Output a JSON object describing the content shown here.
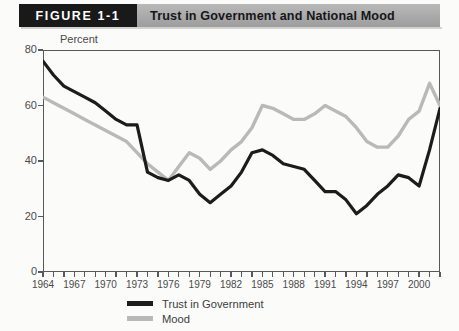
{
  "header": {
    "figure_tag": "FIGURE 1-1",
    "title": "Trust in Government and National Mood"
  },
  "chart_data": {
    "type": "line",
    "title": "Trust in Government and National Mood",
    "xlabel": "",
    "ylabel": "Percent",
    "ylim": [
      0,
      80
    ],
    "xlim": [
      1964,
      2002
    ],
    "yticks": [
      0,
      20,
      40,
      60,
      80
    ],
    "xticks": [
      1964,
      1967,
      1970,
      1973,
      1976,
      1979,
      1982,
      1985,
      1988,
      1991,
      1994,
      1997,
      2000
    ],
    "x_tick_interval_minor": 1,
    "grid": false,
    "legend_position": "bottom-center",
    "x": [
      1964,
      1965,
      1966,
      1967,
      1968,
      1969,
      1970,
      1971,
      1972,
      1973,
      1974,
      1975,
      1976,
      1977,
      1978,
      1979,
      1980,
      1981,
      1982,
      1983,
      1984,
      1985,
      1986,
      1987,
      1988,
      1989,
      1990,
      1991,
      1992,
      1993,
      1994,
      1995,
      1996,
      1997,
      1998,
      1999,
      2000,
      2001,
      2002
    ],
    "series": [
      {
        "name": "Trust in Government",
        "color": "#1c1c1c",
        "values": [
          76,
          71,
          67,
          65,
          63,
          61,
          58,
          55,
          53,
          53,
          36,
          34,
          33,
          35,
          33,
          28,
          25,
          28,
          31,
          36,
          43,
          44,
          42,
          39,
          38,
          37,
          33,
          29,
          29,
          26,
          21,
          24,
          28,
          31,
          35,
          34,
          31,
          44,
          59
        ]
      },
      {
        "name": "Mood",
        "color": "#b9b9b9",
        "values": [
          63,
          61,
          59,
          57,
          55,
          53,
          51,
          49,
          47,
          43,
          39,
          36,
          33,
          38,
          43,
          41,
          37,
          40,
          44,
          47,
          52,
          60,
          59,
          57,
          55,
          55,
          57,
          60,
          58,
          56,
          52,
          47,
          45,
          45,
          49,
          55,
          58,
          68,
          60
        ]
      }
    ]
  },
  "legend": [
    {
      "label": "Trust in Government",
      "color": "#1c1c1c"
    },
    {
      "label": "Mood",
      "color": "#b9b9b9"
    }
  ],
  "axis": {
    "y_title": "Percent",
    "y_ticks": [
      "80",
      "60",
      "40",
      "20",
      "0"
    ],
    "x_ticks": [
      "1964",
      "1967",
      "1970",
      "1973",
      "1976",
      "1979",
      "1982",
      "1985",
      "1988",
      "1991",
      "1994",
      "1997",
      "2000"
    ]
  }
}
